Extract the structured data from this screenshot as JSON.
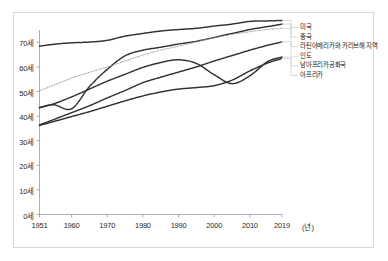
{
  "chart_data": {
    "type": "line",
    "title": "",
    "xlabel": "년",
    "ylabel": "",
    "xlim": [
      1951,
      2019
    ],
    "ylim": [
      0,
      75
    ],
    "grid": false,
    "legend_position": "right",
    "x_ticks": [
      "1951",
      "1960",
      "1970",
      "1980",
      "1990",
      "2000",
      "2010",
      "2019"
    ],
    "x_tick_values": [
      1951,
      1960,
      1970,
      1980,
      1990,
      2000,
      2010,
      2019
    ],
    "y_ticks": [
      "0세",
      "10세",
      "20세",
      "30세",
      "40세",
      "50세",
      "60세",
      "70세"
    ],
    "y_tick_values": [
      0,
      10,
      20,
      30,
      40,
      50,
      60,
      70
    ],
    "x_unit_label": "(년)",
    "series": [
      {
        "name": "미국",
        "color": "#303030",
        "style": "dotted",
        "x": [
          1951,
          1955,
          1960,
          1965,
          1970,
          1975,
          1980,
          1985,
          1990,
          1995,
          2000,
          2005,
          2010,
          2015,
          2019
        ],
        "values": [
          68.4,
          69.2,
          69.8,
          70.1,
          70.8,
          72.5,
          73.6,
          74.6,
          75.2,
          75.7,
          76.6,
          77.4,
          78.5,
          78.7,
          78.9
        ]
      },
      {
        "name": "중국",
        "color": "#303030",
        "style": "dotted",
        "x": [
          1951,
          1955,
          1960,
          1965,
          1970,
          1975,
          1980,
          1985,
          1990,
          1995,
          2000,
          2005,
          2010,
          2015,
          2019
        ],
        "values": [
          43.5,
          44.6,
          43.0,
          52.0,
          59.0,
          64.5,
          66.8,
          68.0,
          69.3,
          70.4,
          72.0,
          73.6,
          75.2,
          76.4,
          77.4
        ]
      },
      {
        "name": "라틴아메리카와 카리브해 지역",
        "color": "#9a9a9a",
        "style": "dotted",
        "x": [
          1951,
          1955,
          1960,
          1965,
          1970,
          1975,
          1980,
          1985,
          1990,
          1995,
          2000,
          2005,
          2010,
          2015,
          2019
        ],
        "values": [
          50.2,
          52.6,
          55.4,
          57.8,
          60.0,
          62.4,
          64.8,
          66.8,
          68.4,
          70.2,
          71.8,
          73.2,
          74.3,
          75.2,
          75.7
        ]
      },
      {
        "name": "인도",
        "color": "#303030",
        "style": "dotted",
        "x": [
          1951,
          1955,
          1960,
          1965,
          1970,
          1975,
          1980,
          1985,
          1990,
          1995,
          2000,
          2005,
          2010,
          2015,
          2019
        ],
        "values": [
          36.4,
          38.6,
          41.4,
          44.2,
          47.4,
          50.4,
          53.6,
          55.8,
          57.9,
          60.0,
          62.4,
          64.6,
          66.8,
          68.8,
          70.2
        ]
      },
      {
        "name": "남아프리카공화국",
        "color": "#303030",
        "style": "dotted",
        "x": [
          1951,
          1955,
          1960,
          1965,
          1970,
          1975,
          1980,
          1985,
          1990,
          1995,
          2000,
          2005,
          2010,
          2015,
          2019
        ],
        "values": [
          43.4,
          45.0,
          47.8,
          51.0,
          54.2,
          57.0,
          59.8,
          61.8,
          62.9,
          61.4,
          56.8,
          53.2,
          56.4,
          62.2,
          64.0
        ]
      },
      {
        "name": "아프리카",
        "color": "#303030",
        "style": "dotted",
        "x": [
          1951,
          1955,
          1960,
          1965,
          1970,
          1975,
          1980,
          1985,
          1990,
          1995,
          2000,
          2005,
          2010,
          2015,
          2019
        ],
        "values": [
          36.2,
          37.8,
          39.8,
          41.8,
          44.0,
          46.2,
          48.2,
          49.8,
          51.0,
          51.6,
          52.4,
          54.6,
          58.4,
          61.6,
          63.4
        ]
      }
    ]
  },
  "legend": {
    "items": [
      {
        "label": "미국"
      },
      {
        "label": "중국"
      },
      {
        "label": "라틴아메리카와 카리브해 지역"
      },
      {
        "label": "인도"
      },
      {
        "label": "남아프리카공화국"
      },
      {
        "label": "아프리카"
      }
    ]
  }
}
